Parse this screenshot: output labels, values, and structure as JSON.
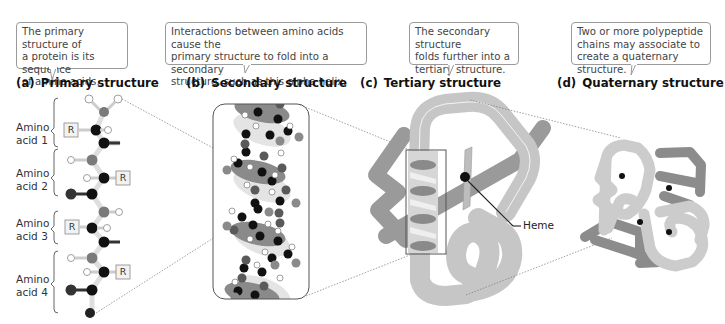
{
  "panels": [
    {
      "id": "a",
      "letter": "(a)",
      "title": "Primary structure",
      "callout": "The primary structure of a protein is its sequence of amino acids.",
      "callout_lines": [
        "The primary structure of",
        "a protein is its sequence",
        "of amino acids."
      ]
    },
    {
      "id": "b",
      "letter": "(b)",
      "title": "Secondary structure",
      "callout": "Interactions between amino acids cause the primary structure to fold into a secondary structure, such as this alpha helix.",
      "callout_lines": [
        "Interactions between amino acids cause the",
        "primary structure to fold into a secondary",
        "structure, such as this alpha helix."
      ]
    },
    {
      "id": "c",
      "letter": "(c)",
      "title": "Tertiary structure",
      "callout": "The secondary structure folds further into a tertiary structure.",
      "callout_lines": [
        "The secondary structure",
        "folds further into a",
        "tertiary structure."
      ],
      "pointer_label": "Heme"
    },
    {
      "id": "d",
      "letter": "(d)",
      "title": "Quaternary structure",
      "callout": "Two or more polypeptide chains may associate to create a quaternary structure.",
      "callout_lines": [
        "Two or more polypeptide",
        "chains may associate to",
        "create a quaternary structure."
      ]
    }
  ],
  "amino_acids": [
    {
      "line1": "Amino",
      "line2": "acid 1",
      "r_group": "R",
      "r_side": "left"
    },
    {
      "line1": "Amino",
      "line2": "acid 2",
      "r_group": "R",
      "r_side": "right"
    },
    {
      "line1": "Amino",
      "line2": "acid 3",
      "r_group": "R",
      "r_side": "left"
    },
    {
      "line1": "Amino",
      "line2": "acid 4",
      "r_group": "R",
      "r_side": "right"
    }
  ],
  "colors": {
    "atom_black": "#111111",
    "atom_gray": "#7a7a7a",
    "atom_dark": "#3a3a3a",
    "ribbon_light": "#c4c4c4",
    "ribbon_mid": "#9a9a9a",
    "ribbon_dark": "#7c7c7c",
    "helix_oval": "#8a8a8a",
    "callout_border": "#9a9a9a"
  }
}
